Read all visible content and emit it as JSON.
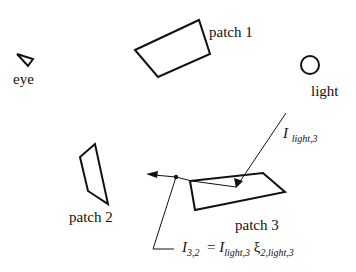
{
  "labels": {
    "eye": "eye",
    "patch1": "patch 1",
    "light": "light",
    "patch2": "patch 2",
    "patch3": "patch 3"
  },
  "formula_incident": {
    "symbol": "I",
    "subscript": "light,3"
  },
  "formula_reflected": {
    "lhs_symbol": "I",
    "lhs_subscript": "3,2",
    "equals": "=",
    "rhs_symbol": "I",
    "rhs_subscript": "light,3",
    "xi_symbol": "ξ",
    "xi_subscript": "2,light,3"
  },
  "colors": {
    "stroke": "#111111",
    "background": "#ffffff"
  }
}
